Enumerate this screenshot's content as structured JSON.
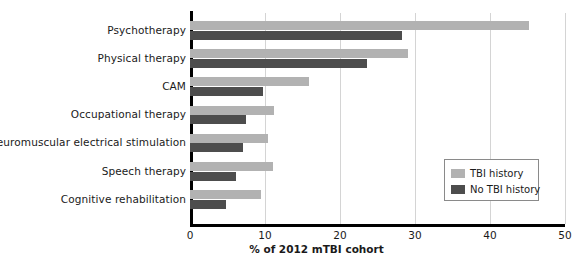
{
  "chart_data": {
    "type": "bar",
    "orientation": "horizontal",
    "title": "",
    "xlabel": "% of 2012 mTBI cohort",
    "ylabel": "",
    "xlim": [
      0,
      50
    ],
    "xticks": [
      0,
      10,
      20,
      30,
      40,
      50
    ],
    "grid": "vertical",
    "legend_position": "middle-right",
    "categories": [
      "Psychotherapy",
      "Physical therapy",
      "CAM",
      "Occupational therapy",
      "Neuromuscular electrical stimulation",
      "Speech therapy",
      "Cognitive rehabilitation"
    ],
    "series": [
      {
        "name": "TBI history",
        "color": "#b2b2b2",
        "values": [
          45.2,
          29.0,
          15.9,
          11.2,
          10.4,
          11.1,
          9.5
        ]
      },
      {
        "name": "No TBI history",
        "color": "#4d4d4d",
        "values": [
          28.3,
          23.6,
          9.7,
          7.4,
          7.1,
          6.1,
          4.8
        ]
      }
    ]
  },
  "legend": {
    "items": [
      {
        "label": "TBI history",
        "swatch": "light"
      },
      {
        "label": "No TBI history",
        "swatch": "dark"
      }
    ]
  }
}
